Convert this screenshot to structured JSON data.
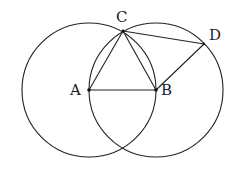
{
  "diagram": {
    "colors": {
      "stroke": "#222222",
      "background": "#ffffff",
      "text": "#222222"
    },
    "points": {
      "A": {
        "label": "A",
        "x": 89,
        "y": 90,
        "label_x": 70,
        "label_y": 95
      },
      "B": {
        "label": "B",
        "x": 156,
        "y": 90,
        "label_x": 161,
        "label_y": 95
      },
      "C": {
        "label": "C",
        "x": 123,
        "y": 31,
        "label_x": 116,
        "label_y": 22
      },
      "D": {
        "label": "D",
        "x": 204,
        "y": 44,
        "label_x": 209,
        "label_y": 40
      }
    },
    "circles": [
      {
        "name": "circle-A",
        "center": "A",
        "r": 67
      },
      {
        "name": "circle-B",
        "center": "B",
        "r": 67
      }
    ],
    "segments": [
      [
        "A",
        "B"
      ],
      [
        "A",
        "C"
      ],
      [
        "B",
        "C"
      ],
      [
        "C",
        "D"
      ],
      [
        "B",
        "D"
      ]
    ]
  }
}
